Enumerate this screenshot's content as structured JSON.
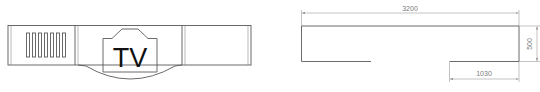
{
  "front_view": {
    "label": "TV",
    "vent_slots": 7
  },
  "top_view": {
    "dimensions": {
      "overall_width": "3200",
      "depth": "500",
      "side_segment": "1030"
    }
  },
  "colors": {
    "line": "#5a5a5a",
    "dimension_line": "#9a9a9a",
    "dimension_text": "#7a7a7a",
    "label_text": "#111111",
    "background": "#ffffff"
  }
}
